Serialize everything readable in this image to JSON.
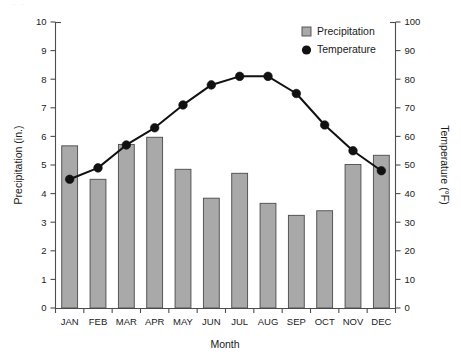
{
  "chart_data": {
    "type": "bar",
    "title": "",
    "subtitle": "",
    "xlabel": "Month",
    "ylabel": "Precipitation (in.)",
    "y2label": "Temperature (°F)",
    "categories": [
      "JAN",
      "FEB",
      "MAR",
      "APR",
      "MAY",
      "JUN",
      "JUL",
      "AUG",
      "SEP",
      "OCT",
      "NOV",
      "DEC"
    ],
    "ylim": [
      0,
      10
    ],
    "y2lim": [
      0,
      100
    ],
    "yticks": [
      "0",
      "1",
      "2",
      "3",
      "4",
      "5",
      "6",
      "7",
      "8",
      "9",
      "10"
    ],
    "y2ticks": [
      "0",
      "10",
      "20",
      "30",
      "40",
      "50",
      "60",
      "70",
      "80",
      "90",
      "100"
    ],
    "grid": false,
    "legend_position": "top-right",
    "series": [
      {
        "name": "Precipitation",
        "type": "bar",
        "axis": "left",
        "units": "in.",
        "color": "#a9a9a9",
        "edge_color": "#4a4a4a",
        "values": [
          5.67,
          4.5,
          5.72,
          5.97,
          4.85,
          3.84,
          4.71,
          3.66,
          3.24,
          3.4,
          5.02,
          5.34
        ]
      },
      {
        "name": "Temperature",
        "type": "line",
        "axis": "right",
        "units": "°F",
        "color": "#111111",
        "marker": "circle",
        "values": [
          45,
          49,
          57,
          63,
          71,
          78,
          81,
          81,
          75,
          64,
          55,
          48
        ]
      }
    ]
  },
  "legend": {
    "items": [
      {
        "label": "Precipitation",
        "marker": "square-swatch"
      },
      {
        "label": "Temperature",
        "marker": "filled-circle"
      }
    ]
  },
  "axes": {
    "left_title": "Precipitation (in.)",
    "right_title": "Temperature (°F)",
    "bottom_title": "Month"
  }
}
